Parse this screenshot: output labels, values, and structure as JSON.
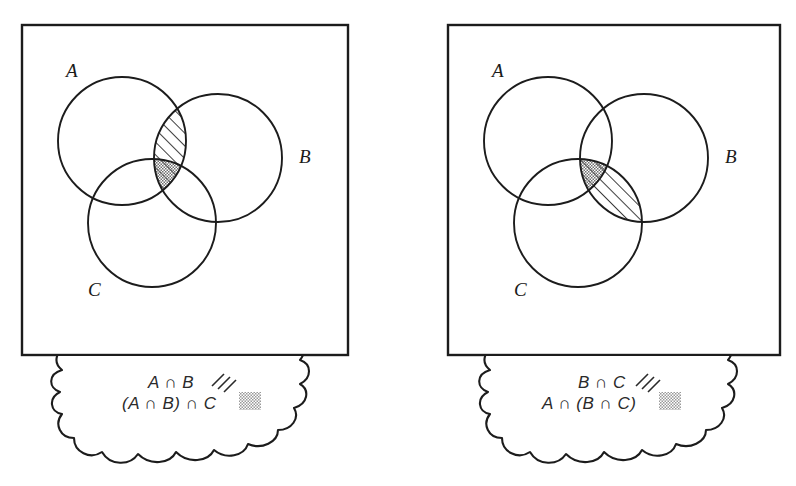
{
  "figure": {
    "panel_count": 2,
    "ink_color": "#1c1c1c",
    "background_color": "#ffffff",
    "hatch_color": "#2a2a2a",
    "stipple_color": "#8a8a8a"
  },
  "panels": [
    {
      "id": "left-panel",
      "name": "left-venn-panel",
      "universe_box": {
        "x": 22,
        "y": 25,
        "width": 326,
        "height": 330
      },
      "circles": [
        {
          "set": "A",
          "cx": 122,
          "cy": 141,
          "r": 64,
          "label": "A",
          "label_x": 66,
          "label_y": 77
        },
        {
          "set": "B",
          "cx": 218,
          "cy": 158,
          "r": 64,
          "label": "B",
          "label_x": 299,
          "label_y": 163
        },
        {
          "set": "C",
          "cx": 152,
          "cy": 223,
          "r": 64,
          "label": "C",
          "label_x": 88,
          "label_y": 296
        }
      ],
      "shading": [
        {
          "region": "A∩B",
          "pattern": "diagonal-hatch"
        },
        {
          "region": "(A∩B)∩C",
          "pattern": "diagonal-hatch+stipple"
        }
      ],
      "cloud": {
        "name": "left-thought-cloud",
        "lines": [
          {
            "expression": "A ∩ B",
            "swatch": "hatch"
          },
          {
            "expression": "(A ∩ B) ∩ C",
            "swatch": "stipple"
          }
        ]
      }
    },
    {
      "id": "right-panel",
      "name": "right-venn-panel",
      "universe_box": {
        "x": 448,
        "y": 25,
        "width": 332,
        "height": 330
      },
      "circles": [
        {
          "set": "A",
          "cx": 548,
          "cy": 141,
          "r": 64,
          "label": "A",
          "label_x": 492,
          "label_y": 77
        },
        {
          "set": "B",
          "cx": 644,
          "cy": 158,
          "r": 64,
          "label": "B",
          "label_x": 725,
          "label_y": 163
        },
        {
          "set": "C",
          "cx": 578,
          "cy": 223,
          "r": 64,
          "label": "C",
          "label_x": 514,
          "label_y": 296
        }
      ],
      "shading": [
        {
          "region": "B∩C",
          "pattern": "diagonal-hatch"
        },
        {
          "region": "A∩(B∩C)",
          "pattern": "diagonal-hatch+stipple"
        }
      ],
      "cloud": {
        "name": "right-thought-cloud",
        "lines": [
          {
            "expression": "B ∩ C",
            "swatch": "hatch"
          },
          {
            "expression": "A ∩ (B ∩ C)",
            "swatch": "stipple"
          }
        ]
      }
    }
  ],
  "legend": {
    "hatch_meaning": "diagonal hatch swatch",
    "stipple_meaning": "gray stipple swatch"
  }
}
